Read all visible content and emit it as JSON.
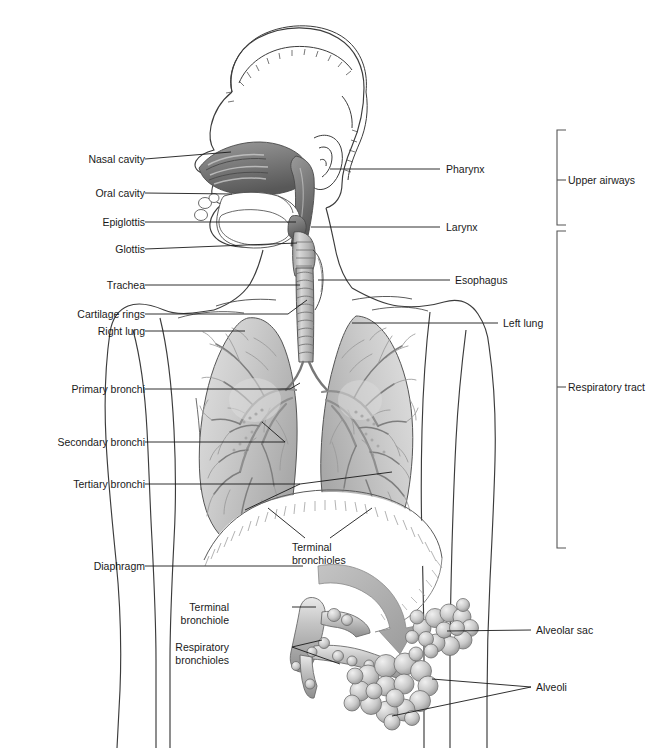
{
  "figure": {
    "type": "anatomical-diagram",
    "palette": {
      "outline": "#3c3c3c",
      "leader_line": "#1a1a1a",
      "text": "#1a1a1a",
      "tissue_light": "#d6d6d6",
      "tissue_mid": "#b4b4b4",
      "tissue_dark": "#8a8a8a",
      "cavity_dark": "#6e6e6e",
      "arrow_gray": "#a9a9a9",
      "bracket": "#555555",
      "background": "#ffffff"
    }
  },
  "labels_left": [
    {
      "text": "Nasal cavity",
      "x": 70,
      "y": 153,
      "lx1": 145,
      "ly1": 159,
      "lx2": 231,
      "ly2": 152
    },
    {
      "text": "Oral cavity",
      "x": 76,
      "y": 187,
      "lx1": 145,
      "ly1": 193,
      "lx2": 232,
      "ly2": 194
    },
    {
      "text": "Epiglottis",
      "x": 78,
      "y": 216,
      "lx1": 145,
      "ly1": 222,
      "lx2": 296,
      "ly2": 222
    },
    {
      "text": "Glottis",
      "x": 88,
      "y": 243,
      "lx1": 145,
      "ly1": 249,
      "lx2": 297,
      "ly2": 243
    },
    {
      "text": "Trachea",
      "x": 82,
      "y": 279,
      "lx1": 145,
      "ly1": 285,
      "lx2": 300,
      "ly2": 285
    },
    {
      "text": "Cartilage rings",
      "x": 28,
      "y": 308,
      "lx1": 145,
      "ly1": 314,
      "lx2": 288,
      "ly2": 314
    },
    {
      "text": "Right lung",
      "x": 27,
      "y": 325,
      "lx1": 145,
      "ly1": 331,
      "lx2": 245,
      "ly2": 331
    },
    {
      "text": "Primary bronchi",
      "x": 28,
      "y": 383,
      "lx1": 145,
      "ly1": 389,
      "lx2": 290,
      "ly2": 389
    },
    {
      "text": "Secondary bronchi",
      "x": 20,
      "y": 436,
      "lx1": 145,
      "ly1": 442,
      "lx2": 285,
      "ly2": 442
    },
    {
      "text": "Tertiary bronchi",
      "x": 20,
      "y": 478,
      "lx1": 145,
      "ly1": 484,
      "lx2": 300,
      "ly2": 484
    },
    {
      "text": "Diaphragm",
      "x": 28,
      "y": 560,
      "lx1": 145,
      "ly1": 566,
      "lx2": 303,
      "ly2": 566
    }
  ],
  "labels_right": [
    {
      "text": "Pharynx",
      "x": 446,
      "y": 163,
      "lx1": 440,
      "ly1": 169,
      "lx2": 330,
      "ly2": 169
    },
    {
      "text": "Larynx",
      "x": 446,
      "y": 221,
      "lx1": 440,
      "ly1": 227,
      "lx2": 311,
      "ly2": 227
    },
    {
      "text": "Esophagus",
      "x": 455,
      "y": 274,
      "lx1": 450,
      "ly1": 280,
      "lx2": 318,
      "ly2": 280
    },
    {
      "text": "Left lung",
      "x": 503,
      "y": 317,
      "lx1": 498,
      "ly1": 323,
      "lx2": 352,
      "ly2": 323
    }
  ],
  "labels_inline": [
    {
      "text": "Terminal\nbronchioles",
      "x": 292,
      "y": 541
    },
    {
      "text": "Terminal\nbronchiole",
      "x": 229,
      "y": 601
    },
    {
      "text": "Respiratory\nbronchioles",
      "x": 229,
      "y": 641
    }
  ],
  "labels_detail_right": [
    {
      "text": "Alveolar sac",
      "x": 536,
      "y": 624,
      "lx1": 531,
      "ly1": 630,
      "lx2": 447,
      "ly2": 631
    },
    {
      "text": "Alveoli",
      "x": 536,
      "y": 681,
      "lx1": 531,
      "ly1": 687,
      "lx2": 432,
      "ly2": 679
    }
  ],
  "brackets": [
    {
      "label": "Upper airways",
      "x": 568,
      "y": 174,
      "top": 130,
      "bottom": 225,
      "bx": 557,
      "tickY": 180
    },
    {
      "label": "Respiratory tract",
      "x": 568,
      "y": 381,
      "top": 231,
      "bottom": 548,
      "bx": 557,
      "tickY": 387
    }
  ],
  "structures": [
    "head-profile",
    "hair",
    "ear",
    "nasal-cavity",
    "oral-cavity",
    "tongue",
    "epiglottis",
    "glottis",
    "pharynx",
    "larynx",
    "trachea",
    "cartilage-rings",
    "esophagus",
    "right-lung",
    "left-lung",
    "bronchial-tree",
    "diaphragm",
    "torso-outline",
    "arms",
    "zoom-arrow",
    "terminal-bronchiole",
    "respiratory-bronchioles",
    "alveolar-sac",
    "alveoli-clusters"
  ]
}
